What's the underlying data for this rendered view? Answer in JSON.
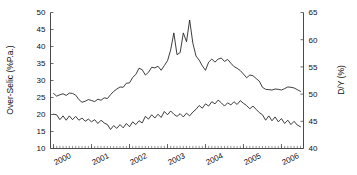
{
  "figure": {
    "background": "#ffffff",
    "line_color": "#1b1b1b",
    "axis_color": "#4a4a4a",
    "width": 357,
    "height": 175
  },
  "chart_data": {
    "type": "line",
    "title": "",
    "xlabel": "",
    "ylabel": "Over-Selic (%P.a.)",
    "y2label": "D/Y (%)",
    "grid": false,
    "legend": "none",
    "xlim": [
      1999.92,
      2006.58
    ],
    "ylim": [
      10,
      50
    ],
    "y2lim": [
      40,
      65
    ],
    "yticks": [
      10,
      15,
      20,
      25,
      30,
      35,
      40,
      45,
      50
    ],
    "y2ticks": [
      40,
      45,
      50,
      55,
      60,
      65
    ],
    "xticks": [
      2000,
      2001,
      2002,
      2003,
      2004,
      2005,
      2006
    ],
    "xtick_labels": [
      "2000",
      "2001",
      "2002",
      "2003",
      "2004",
      "2005",
      "2006"
    ],
    "xtick_rotation": -25,
    "minor_x_ticks": true,
    "series": [
      {
        "name": "Over-Selic (%P.a.)",
        "axis": "left",
        "units": "%P.a.",
        "x": [
          2000.0,
          2000.083,
          2000.167,
          2000.25,
          2000.333,
          2000.417,
          2000.5,
          2000.583,
          2000.667,
          2000.75,
          2000.833,
          2000.917,
          2001.0,
          2001.083,
          2001.167,
          2001.25,
          2001.333,
          2001.417,
          2001.5,
          2001.583,
          2001.667,
          2001.75,
          2001.833,
          2001.917,
          2002.0,
          2002.083,
          2002.167,
          2002.25,
          2002.333,
          2002.417,
          2002.5,
          2002.583,
          2002.667,
          2002.75,
          2002.833,
          2002.917,
          2003.0,
          2003.083,
          2003.167,
          2003.25,
          2003.333,
          2003.417,
          2003.5,
          2003.583,
          2003.667,
          2003.75,
          2003.833,
          2003.917,
          2004.0,
          2004.083,
          2004.167,
          2004.25,
          2004.333,
          2004.417,
          2004.5,
          2004.583,
          2004.667,
          2004.75,
          2004.833,
          2004.917,
          2005.0,
          2005.083,
          2005.167,
          2005.25,
          2005.333,
          2005.417,
          2005.5,
          2005.583,
          2005.667,
          2005.75,
          2005.833,
          2005.917,
          2006.0,
          2006.083,
          2006.167,
          2006.25,
          2006.333,
          2006.417,
          2006.5
        ],
        "values": [
          26.2,
          25.4,
          25.8,
          26.1,
          25.6,
          26.3,
          26.2,
          25.7,
          24.4,
          23.6,
          23.9,
          24.4,
          24.1,
          23.8,
          24.5,
          24.2,
          24.9,
          24.7,
          25.8,
          26.8,
          27.5,
          28.1,
          28.0,
          29.2,
          29.3,
          30.9,
          31.8,
          33.6,
          33.2,
          31.6,
          32.4,
          33.9,
          33.7,
          34.2,
          33.0,
          34.4,
          35.8,
          39.0,
          44.0,
          37.6,
          38.2,
          44.0,
          41.4,
          47.8,
          41.0,
          37.2,
          36.0,
          34.3,
          33.0,
          35.4,
          36.3,
          35.4,
          36.3,
          36.6,
          35.6,
          36.2,
          35.1,
          34.1,
          33.6,
          32.9,
          31.9,
          30.8,
          31.6,
          31.4,
          30.6,
          29.8,
          28.0,
          27.4,
          27.3,
          27.2,
          27.5,
          27.4,
          27.2,
          27.6,
          28.1,
          28.0,
          27.8,
          27.3,
          26.8
        ]
      },
      {
        "name": "D/Y (%)",
        "axis": "right",
        "units": "%",
        "x": [
          2000.0,
          2000.083,
          2000.167,
          2000.25,
          2000.333,
          2000.417,
          2000.5,
          2000.583,
          2000.667,
          2000.75,
          2000.833,
          2000.917,
          2001.0,
          2001.083,
          2001.167,
          2001.25,
          2001.333,
          2001.417,
          2001.5,
          2001.583,
          2001.667,
          2001.75,
          2001.833,
          2001.917,
          2002.0,
          2002.083,
          2002.167,
          2002.25,
          2002.333,
          2002.417,
          2002.5,
          2002.583,
          2002.667,
          2002.75,
          2002.833,
          2002.917,
          2003.0,
          2003.083,
          2003.167,
          2003.25,
          2003.333,
          2003.417,
          2003.5,
          2003.583,
          2003.667,
          2003.75,
          2003.833,
          2003.917,
          2004.0,
          2004.083,
          2004.167,
          2004.25,
          2004.333,
          2004.417,
          2004.5,
          2004.583,
          2004.667,
          2004.75,
          2004.833,
          2004.917,
          2005.0,
          2005.083,
          2005.167,
          2005.25,
          2005.333,
          2005.417,
          2005.5,
          2005.583,
          2005.667,
          2005.75,
          2005.833,
          2005.917,
          2006.0,
          2006.083,
          2006.167,
          2006.25,
          2006.333,
          2006.417,
          2006.5
        ],
        "values": [
          46.3,
          46.2,
          45.3,
          46.0,
          45.2,
          46.0,
          45.3,
          45.9,
          45.2,
          45.6,
          45.0,
          45.4,
          44.9,
          45.3,
          44.6,
          45.2,
          44.7,
          44.4,
          43.5,
          44.2,
          43.7,
          44.4,
          43.8,
          44.6,
          44.0,
          44.9,
          44.4,
          45.1,
          44.7,
          45.9,
          45.4,
          46.2,
          45.6,
          46.3,
          45.7,
          46.8,
          46.2,
          46.9,
          46.3,
          45.9,
          46.4,
          45.8,
          46.5,
          46.0,
          46.7,
          47.2,
          47.9,
          47.4,
          48.2,
          47.8,
          48.6,
          48.2,
          48.9,
          48.4,
          47.8,
          48.4,
          48.0,
          48.6,
          48.1,
          48.8,
          48.3,
          47.9,
          47.3,
          47.8,
          47.2,
          46.6,
          46.2,
          45.2,
          46.0,
          45.1,
          45.8,
          44.9,
          45.5,
          44.6,
          45.2,
          44.4,
          45.0,
          44.3,
          44.0
        ]
      }
    ]
  },
  "axes": {
    "left_title": "Over-Selic (%P.a.)",
    "right_title": "D/Y (%)",
    "left_ticks": [
      "50",
      "45",
      "40",
      "35",
      "30",
      "25",
      "20",
      "15",
      "10"
    ],
    "right_ticks": [
      "65",
      "60",
      "55",
      "50",
      "45",
      "40"
    ],
    "x_labels": [
      "2000",
      "2001",
      "2002",
      "2003",
      "2004",
      "2005",
      "2006"
    ]
  }
}
